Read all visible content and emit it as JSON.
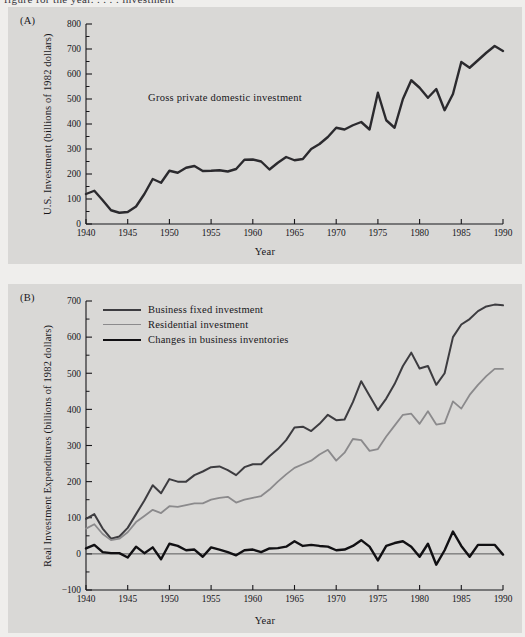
{
  "page": {
    "cropped_top_text": "figure for the year.  .  .  .  .  investment",
    "background_color": "#efeeec",
    "panel_color": "#d9d8d6",
    "ink_color": "#17161a"
  },
  "panelA": {
    "tag": "(A)",
    "ylabel": "U.S. Investment (billions of 1982 dollars)",
    "xlabel": "Year",
    "annotation": "Gross private domestic investment"
  },
  "panelB": {
    "tag": "(B)",
    "ylabel": "Real Investment Expenditures (billions of 1982 dollars)",
    "xlabel": "Year",
    "legend": [
      {
        "label": "Business fixed investment",
        "color": "#3d3c40",
        "width": 2.0
      },
      {
        "label": "Residential investment",
        "color": "#8b8a8c",
        "width": 1.8
      },
      {
        "label": "Changes in business inventories",
        "color": "#111013",
        "width": 2.4
      }
    ]
  },
  "chart_data": [
    {
      "id": "panel-a",
      "type": "line",
      "title": "(A) U.S. Investment",
      "xlabel": "Year",
      "ylabel": "U.S. Investment (billions of 1982 dollars)",
      "xlim": [
        1940,
        1990
      ],
      "ylim": [
        0,
        800
      ],
      "xticks": [
        1940,
        1945,
        1950,
        1955,
        1960,
        1965,
        1970,
        1975,
        1980,
        1985,
        1990
      ],
      "yticks": [
        0,
        100,
        200,
        300,
        400,
        500,
        600,
        700,
        800
      ],
      "y_minor_step": 50,
      "grid": false,
      "legend": "none",
      "annotations": [
        {
          "text": "Gross private domestic investment",
          "x": 1958,
          "y": 500
        }
      ],
      "series": [
        {
          "name": "Gross private domestic investment",
          "color": "#2b2a2e",
          "linewidth": 2.4,
          "x": [
            1940,
            1941,
            1942,
            1943,
            1944,
            1945,
            1946,
            1947,
            1948,
            1949,
            1950,
            1951,
            1952,
            1953,
            1954,
            1955,
            1956,
            1957,
            1958,
            1959,
            1960,
            1961,
            1962,
            1963,
            1964,
            1965,
            1966,
            1967,
            1968,
            1969,
            1970,
            1971,
            1972,
            1973,
            1974,
            1975,
            1976,
            1977,
            1978,
            1979,
            1980,
            1981,
            1982,
            1983,
            1984,
            1985,
            1986,
            1987,
            1988,
            1989,
            1990
          ],
          "y": [
            120,
            133,
            95,
            55,
            45,
            48,
            70,
            120,
            180,
            165,
            213,
            205,
            225,
            232,
            212,
            213,
            215,
            210,
            220,
            257,
            258,
            250,
            218,
            245,
            268,
            255,
            260,
            300,
            320,
            348,
            385,
            378,
            395,
            408,
            378,
            525,
            415,
            385,
            500,
            575,
            545,
            505,
            540,
            455,
            520,
            648,
            625,
            655,
            685,
            712,
            692
          ]
        }
      ]
    },
    {
      "id": "panel-b",
      "type": "line",
      "title": "(B) Real Investment Expenditures",
      "xlabel": "Year",
      "ylabel": "Real Investment Expenditures (billions of 1982 dollars)",
      "xlim": [
        1940,
        1990
      ],
      "ylim": [
        -100,
        700
      ],
      "xticks": [
        1940,
        1945,
        1950,
        1955,
        1960,
        1965,
        1970,
        1975,
        1980,
        1985,
        1990
      ],
      "yticks": [
        -100,
        0,
        100,
        200,
        300,
        400,
        500,
        600,
        700
      ],
      "y_minor_step": 50,
      "grid": false,
      "legend": "upper left",
      "x": [
        1940,
        1941,
        1942,
        1943,
        1944,
        1945,
        1946,
        1947,
        1948,
        1949,
        1950,
        1951,
        1952,
        1953,
        1954,
        1955,
        1956,
        1957,
        1958,
        1959,
        1960,
        1961,
        1962,
        1963,
        1964,
        1965,
        1966,
        1967,
        1968,
        1969,
        1970,
        1971,
        1972,
        1973,
        1974,
        1975,
        1976,
        1977,
        1978,
        1979,
        1980,
        1981,
        1982,
        1983,
        1984,
        1985,
        1986,
        1987,
        1988,
        1989,
        1990
      ],
      "series": [
        {
          "name": "Business fixed investment",
          "color": "#3d3c40",
          "linewidth": 2.0,
          "y": [
            97,
            110,
            70,
            42,
            48,
            72,
            110,
            148,
            190,
            168,
            207,
            200,
            200,
            218,
            228,
            240,
            242,
            232,
            218,
            240,
            248,
            248,
            270,
            290,
            315,
            350,
            352,
            340,
            360,
            385,
            370,
            372,
            420,
            478,
            438,
            398,
            430,
            470,
            520,
            557,
            513,
            520,
            468,
            500,
            600,
            635,
            650,
            672,
            685,
            690,
            688
          ]
        },
        {
          "name": "Residential investment",
          "color": "#8b8a8c",
          "linewidth": 1.8,
          "y": [
            70,
            82,
            55,
            38,
            42,
            60,
            88,
            105,
            122,
            113,
            132,
            130,
            135,
            140,
            140,
            150,
            155,
            158,
            142,
            150,
            155,
            160,
            178,
            200,
            220,
            238,
            248,
            258,
            275,
            288,
            258,
            280,
            318,
            315,
            285,
            290,
            325,
            355,
            385,
            388,
            360,
            395,
            358,
            362,
            422,
            402,
            440,
            468,
            492,
            512,
            512
          ]
        },
        {
          "name": "Changes in business inventories",
          "color": "#111013",
          "linewidth": 2.4,
          "y": [
            15,
            25,
            5,
            2,
            2,
            -10,
            20,
            2,
            18,
            -15,
            28,
            22,
            10,
            12,
            -8,
            18,
            12,
            5,
            -4,
            10,
            12,
            5,
            15,
            16,
            20,
            35,
            22,
            25,
            22,
            20,
            10,
            12,
            22,
            38,
            20,
            -18,
            22,
            30,
            35,
            20,
            -8,
            28,
            -30,
            10,
            62,
            22,
            -8,
            25,
            25,
            25,
            -2
          ]
        }
      ]
    }
  ]
}
